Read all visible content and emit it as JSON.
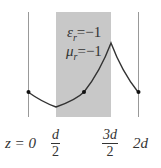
{
  "diagram": {
    "slab": {
      "epsilon_symbol": "ε",
      "epsilon_sub": "r",
      "epsilon_value": "=−1",
      "mu_symbol": "μ",
      "mu_sub": "r",
      "mu_value": "=−1",
      "fill_color": "#c8c8c8"
    },
    "axis_labels": {
      "z0": "z = 0",
      "d_half_num": "d",
      "d_half_den": "2",
      "three_d_half_num": "3d",
      "three_d_half_den": "2",
      "two_d": "2d"
    },
    "curve_color": "#333333",
    "line_color": "#999999"
  }
}
